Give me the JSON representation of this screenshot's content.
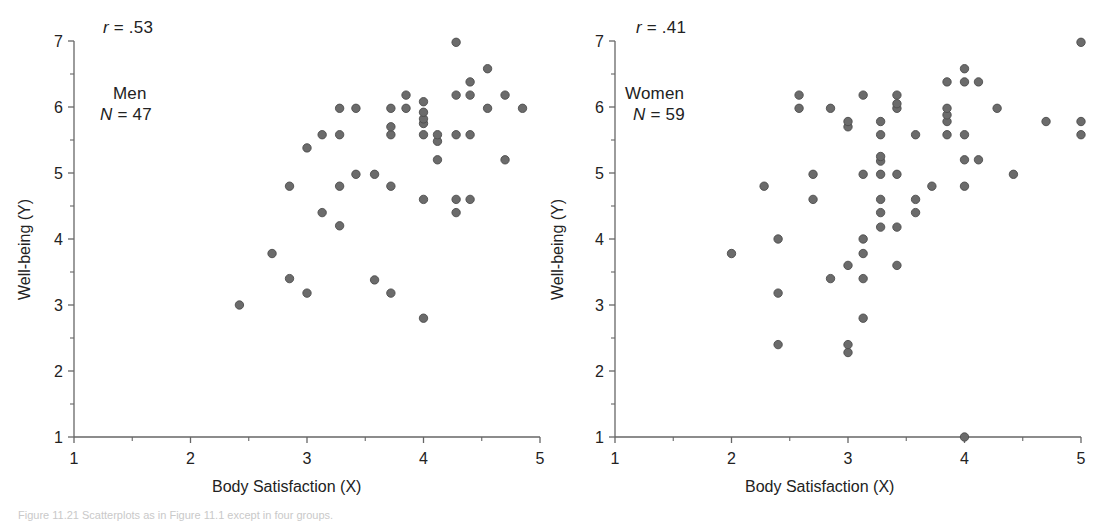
{
  "figure": {
    "background": "#ffffff",
    "marker_color": "#6b6b6b",
    "marker_edge": "#4d4d4d",
    "axis_color": "#666666",
    "caption": "Figure 11.21 Scatterplots as in Figure 11.1 except in four groups."
  },
  "panels": [
    {
      "id": "men",
      "r_label": "r = .53",
      "r_symbol": "r",
      "r_value": "= .53",
      "group_label": "Men",
      "n_symbol": "N",
      "n_value": "= 47",
      "n_label": "N = 47",
      "xlabel": "Body Satisfaction (X)",
      "ylabel": "Well-being (Y)",
      "xticks": [
        "1",
        "2",
        "3",
        "4",
        "5"
      ],
      "yticks": [
        "1",
        "2",
        "3",
        "4",
        "5",
        "6",
        "7"
      ]
    },
    {
      "id": "women",
      "r_label": "r = .41",
      "r_symbol": "r",
      "r_value": "= .41",
      "group_label": "Women",
      "n_symbol": "N",
      "n_value": "= 59",
      "n_label": "N = 59",
      "xlabel": "Body Satisfaction (X)",
      "ylabel": "Well-being (Y)",
      "xticks": [
        "1",
        "2",
        "3",
        "4",
        "5"
      ],
      "yticks": [
        "1",
        "2",
        "3",
        "4",
        "5",
        "6",
        "7"
      ]
    }
  ],
  "chart_data": [
    {
      "type": "scatter",
      "title": "Men",
      "xlabel": "Body Satisfaction (X)",
      "ylabel": "Well-being (Y)",
      "xlim": [
        1,
        5
      ],
      "ylim": [
        1,
        7
      ],
      "xticks": [
        1,
        2,
        3,
        4,
        5
      ],
      "yticks": [
        1,
        2,
        3,
        4,
        5,
        6,
        7
      ],
      "minor_ticks": true,
      "grid": false,
      "legend": "none",
      "annotations": [
        "r = .53",
        "Men",
        "N = 47"
      ],
      "r": 0.53,
      "n": 47,
      "series": [
        {
          "name": "Men",
          "points": [
            [
              2.42,
              3.0
            ],
            [
              2.7,
              3.78
            ],
            [
              2.85,
              3.4
            ],
            [
              2.85,
              4.8
            ],
            [
              3.0,
              3.18
            ],
            [
              3.0,
              5.38
            ],
            [
              3.13,
              4.4
            ],
            [
              3.13,
              5.58
            ],
            [
              3.28,
              4.2
            ],
            [
              3.28,
              4.8
            ],
            [
              3.28,
              5.58
            ],
            [
              3.28,
              5.98
            ],
            [
              3.42,
              4.98
            ],
            [
              3.42,
              5.98
            ],
            [
              3.58,
              3.38
            ],
            [
              3.58,
              4.98
            ],
            [
              3.72,
              3.18
            ],
            [
              3.72,
              4.8
            ],
            [
              3.72,
              5.58
            ],
            [
              3.72,
              5.7
            ],
            [
              3.72,
              5.98
            ],
            [
              3.85,
              5.98
            ],
            [
              3.85,
              6.18
            ],
            [
              4.0,
              2.8
            ],
            [
              4.0,
              4.6
            ],
            [
              4.0,
              5.58
            ],
            [
              4.0,
              5.75
            ],
            [
              4.0,
              5.82
            ],
            [
              4.0,
              5.92
            ],
            [
              4.0,
              6.08
            ],
            [
              4.12,
              5.48
            ],
            [
              4.12,
              5.58
            ],
            [
              4.12,
              5.2
            ],
            [
              4.28,
              4.4
            ],
            [
              4.28,
              4.6
            ],
            [
              4.28,
              5.58
            ],
            [
              4.28,
              6.18
            ],
            [
              4.28,
              6.98
            ],
            [
              4.4,
              4.6
            ],
            [
              4.4,
              5.58
            ],
            [
              4.4,
              6.18
            ],
            [
              4.4,
              6.38
            ],
            [
              4.55,
              5.98
            ],
            [
              4.55,
              6.58
            ],
            [
              4.7,
              5.2
            ],
            [
              4.7,
              6.18
            ],
            [
              4.85,
              5.98
            ]
          ]
        }
      ]
    },
    {
      "type": "scatter",
      "title": "Women",
      "xlabel": "Body Satisfaction (X)",
      "ylabel": "Well-being (Y)",
      "xlim": [
        1,
        5
      ],
      "ylim": [
        1,
        7
      ],
      "xticks": [
        1,
        2,
        3,
        4,
        5
      ],
      "yticks": [
        1,
        2,
        3,
        4,
        5,
        6,
        7
      ],
      "minor_ticks": true,
      "grid": false,
      "legend": "none",
      "annotations": [
        "r = .41",
        "Women",
        "N = 59"
      ],
      "r": 0.41,
      "n": 59,
      "series": [
        {
          "name": "Women",
          "points": [
            [
              2.0,
              3.78
            ],
            [
              2.28,
              4.8
            ],
            [
              2.4,
              2.4
            ],
            [
              2.4,
              3.18
            ],
            [
              2.4,
              4.0
            ],
            [
              2.58,
              5.98
            ],
            [
              2.58,
              6.18
            ],
            [
              2.7,
              4.6
            ],
            [
              2.7,
              4.98
            ],
            [
              2.85,
              3.4
            ],
            [
              2.85,
              5.98
            ],
            [
              3.0,
              2.28
            ],
            [
              3.0,
              2.4
            ],
            [
              3.0,
              3.6
            ],
            [
              3.0,
              5.7
            ],
            [
              3.0,
              5.78
            ],
            [
              3.13,
              2.8
            ],
            [
              3.13,
              3.4
            ],
            [
              3.13,
              3.78
            ],
            [
              3.13,
              4.0
            ],
            [
              3.13,
              4.98
            ],
            [
              3.13,
              6.18
            ],
            [
              3.28,
              4.18
            ],
            [
              3.28,
              4.4
            ],
            [
              3.28,
              4.6
            ],
            [
              3.28,
              4.98
            ],
            [
              3.28,
              5.18
            ],
            [
              3.28,
              5.25
            ],
            [
              3.28,
              5.58
            ],
            [
              3.28,
              5.78
            ],
            [
              3.42,
              3.6
            ],
            [
              3.42,
              4.18
            ],
            [
              3.42,
              4.98
            ],
            [
              3.42,
              5.98
            ],
            [
              3.42,
              6.05
            ],
            [
              3.42,
              6.18
            ],
            [
              3.58,
              4.4
            ],
            [
              3.58,
              4.6
            ],
            [
              3.58,
              5.58
            ],
            [
              3.72,
              4.8
            ],
            [
              3.85,
              5.58
            ],
            [
              3.85,
              5.78
            ],
            [
              3.85,
              5.88
            ],
            [
              3.85,
              5.98
            ],
            [
              3.85,
              6.38
            ],
            [
              4.0,
              1.0
            ],
            [
              4.0,
              4.8
            ],
            [
              4.0,
              5.2
            ],
            [
              4.0,
              5.58
            ],
            [
              4.0,
              6.38
            ],
            [
              4.0,
              6.58
            ],
            [
              4.12,
              5.2
            ],
            [
              4.12,
              6.38
            ],
            [
              4.28,
              5.98
            ],
            [
              4.42,
              4.98
            ],
            [
              4.7,
              5.78
            ],
            [
              5.0,
              5.58
            ],
            [
              5.0,
              5.78
            ],
            [
              5.0,
              6.98
            ]
          ]
        }
      ]
    }
  ]
}
